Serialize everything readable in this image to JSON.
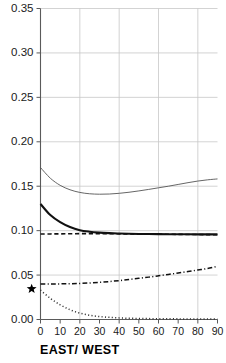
{
  "chart_data": {
    "type": "line",
    "title": "",
    "subtitle": "",
    "xlabel": "EAST/ WEST",
    "ylabel": "",
    "xlim": [
      0,
      90
    ],
    "ylim": [
      0.0,
      0.35
    ],
    "grid": true,
    "legend_position": "none",
    "x_ticks": [
      0,
      10,
      20,
      30,
      40,
      50,
      60,
      70,
      80,
      90
    ],
    "x_tick_labels": [
      "0",
      "10",
      "20",
      "30",
      "40",
      "50",
      "60",
      "70",
      "80",
      "90"
    ],
    "x_gridlines": [
      0,
      20,
      40,
      60,
      80
    ],
    "y_ticks": [
      0.0,
      0.05,
      0.1,
      0.15,
      0.2,
      0.25,
      0.3,
      0.35
    ],
    "y_tick_labels": [
      "0.00",
      "0.05",
      "0.10",
      "0.15",
      "0.20",
      "0.25",
      "0.30",
      "0.35"
    ],
    "y_gridlines": [
      0.0,
      0.05,
      0.1,
      0.15,
      0.2,
      0.25,
      0.3,
      0.35
    ],
    "x": [
      0,
      5,
      10,
      15,
      20,
      25,
      30,
      35,
      40,
      45,
      50,
      55,
      60,
      65,
      70,
      75,
      80,
      85,
      90
    ],
    "series": [
      {
        "name": "thin-solid-upper",
        "style": "solid",
        "width": 0.9,
        "color": "#555555",
        "values": [
          0.171,
          0.159,
          0.151,
          0.146,
          0.143,
          0.1415,
          0.141,
          0.1412,
          0.142,
          0.1432,
          0.1447,
          0.1464,
          0.1482,
          0.15,
          0.152,
          0.154,
          0.1558,
          0.1572,
          0.1582
        ]
      },
      {
        "name": "thick-solid-middle",
        "style": "solid",
        "width": 2.1,
        "color": "#111111",
        "values": [
          0.13,
          0.1175,
          0.1095,
          0.104,
          0.1005,
          0.0988,
          0.0978,
          0.0972,
          0.0968,
          0.0965,
          0.0963,
          0.0962,
          0.0961,
          0.096,
          0.0959,
          0.0959,
          0.0958,
          0.0958,
          0.0958
        ]
      },
      {
        "name": "dashed-flat",
        "style": "dashed",
        "width": 1.6,
        "color": "#111111",
        "values": [
          0.0962,
          0.0963,
          0.0964,
          0.0965,
          0.0966,
          0.0966,
          0.0966,
          0.0965,
          0.0964,
          0.0963,
          0.0962,
          0.0961,
          0.096,
          0.0959,
          0.0958,
          0.0957,
          0.0956,
          0.0955,
          0.0954
        ]
      },
      {
        "name": "dash-dot-rising",
        "style": "dashdot",
        "width": 1.5,
        "color": "#111111",
        "values": [
          0.04,
          0.04,
          0.0401,
          0.0403,
          0.0406,
          0.0411,
          0.0418,
          0.0427,
          0.0438,
          0.045,
          0.0463,
          0.0477,
          0.0492,
          0.0507,
          0.0523,
          0.054,
          0.0557,
          0.0574,
          0.06
        ]
      },
      {
        "name": "dotted-decaying",
        "style": "dotted",
        "width": 1.5,
        "color": "#333333",
        "values": [
          0.033,
          0.0238,
          0.0165,
          0.011,
          0.0072,
          0.0048,
          0.0033,
          0.0024,
          0.0018,
          0.0014,
          0.0012,
          0.001,
          0.0009,
          0.0008,
          0.0007,
          0.0006,
          0.0006,
          0.0005,
          0.0005
        ]
      }
    ],
    "annotations": [
      {
        "name": "star-marker",
        "symbol": "star",
        "x": -4.5,
        "y": 0.0345,
        "label": "★"
      }
    ]
  }
}
